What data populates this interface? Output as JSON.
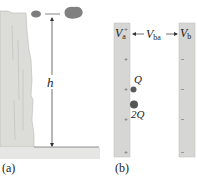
{
  "panel_a": {
    "label": "(a)",
    "height_label": "h",
    "description": "Cliff with falling rock; height h to the ground"
  },
  "panel_b": {
    "label": "(b)",
    "plate_a_label": "V",
    "plate_a_sub": "a",
    "plate_b_label": "V",
    "plate_b_sub": "b",
    "potential_diff_label": "V",
    "potential_diff_sub": "ba",
    "charge_1_label": "Q",
    "charge_2_label": "2Q"
  },
  "colors": {
    "cliff": "#d9d9d6",
    "ground": "#dadad8",
    "rock": "#7a7a7a",
    "plate": "#d4d4d2",
    "charge": "#555555",
    "line": "#333333"
  }
}
